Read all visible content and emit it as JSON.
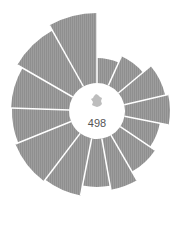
{
  "chart_data": {
    "type": "radial-bar",
    "title": "",
    "center_value": "498",
    "center_icon": "france-map-icon",
    "center": [
      97,
      111
    ],
    "inner_radius": 28,
    "ring_radii": [
      38,
      48,
      58,
      68
    ],
    "color": "#9b9b9b",
    "ring_color": "#e8e8e8",
    "segments": [
      {
        "start": 0,
        "end": 24,
        "outer": 53
      },
      {
        "start": 24,
        "end": 50,
        "outer": 60
      },
      {
        "start": 50,
        "end": 77,
        "outer": 70
      },
      {
        "start": 77,
        "end": 101,
        "outer": 73
      },
      {
        "start": 101,
        "end": 124,
        "outer": 64
      },
      {
        "start": 124,
        "end": 150,
        "outer": 70
      },
      {
        "start": 150,
        "end": 170,
        "outer": 80
      },
      {
        "start": 170,
        "end": 191,
        "outer": 76
      },
      {
        "start": 191,
        "end": 217,
        "outer": 86
      },
      {
        "start": 217,
        "end": 248,
        "outer": 88
      },
      {
        "start": 248,
        "end": 272,
        "outer": 85
      },
      {
        "start": 272,
        "end": 300,
        "outer": 86
      },
      {
        "start": 300,
        "end": 331,
        "outer": 92
      },
      {
        "start": 331,
        "end": 360,
        "outer": 98
      }
    ]
  }
}
